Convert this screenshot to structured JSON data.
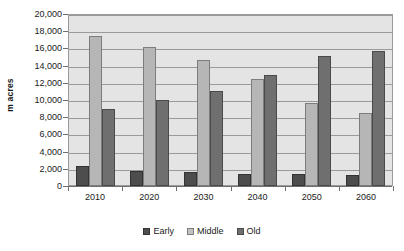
{
  "chart_data": {
    "type": "bar",
    "title": "",
    "subtitle": "",
    "xlabel": "",
    "ylabel": "m acres",
    "categories": [
      "2010",
      "2020",
      "2030",
      "2040",
      "2050",
      "2060"
    ],
    "series": [
      {
        "name": "Early",
        "color": "#4d4d4d",
        "values": [
          2300,
          1700,
          1600,
          1350,
          1350,
          1300
        ]
      },
      {
        "name": "Middle",
        "color": "#b6b6b6",
        "values": [
          17500,
          16200,
          14600,
          12450,
          9650,
          8450
        ]
      },
      {
        "name": "Old",
        "color": "#6f6f6f",
        "values": [
          8900,
          10000,
          11100,
          12900,
          15100,
          15700
        ]
      }
    ],
    "ylim": [
      0,
      20000
    ],
    "ytick_step": 2000,
    "ytick_labels": [
      "20,000",
      "18,000",
      "16,000",
      "14,000",
      "12,000",
      "10,000",
      "8,000",
      "6,000",
      "4,000",
      "2,000",
      "0"
    ],
    "ytick_values": [
      20000,
      18000,
      16000,
      14000,
      12000,
      10000,
      8000,
      6000,
      4000,
      2000,
      0
    ],
    "grid": true,
    "grid_axis": "y",
    "legend_position": "bottom",
    "plot_background": "#e4e4e4",
    "plot_border_color": "#9a9a9a",
    "gridline_color": "#9a9a9a",
    "axis_color": "#6f6f6f",
    "text_color": "#1a1a1a"
  },
  "legend": {
    "items": [
      {
        "label": "Early",
        "swatch": "legend-swatch-early"
      },
      {
        "label": "Middle",
        "swatch": "legend-swatch-middle"
      },
      {
        "label": "Old",
        "swatch": "legend-swatch-old"
      }
    ]
  }
}
